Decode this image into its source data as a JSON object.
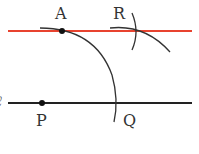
{
  "diagram": {
    "type": "geometric-construction",
    "points": {
      "A": {
        "label": "A",
        "x": 62,
        "y": 31
      },
      "R": {
        "label": "R",
        "x": 134,
        "y": 31
      },
      "P": {
        "label": "P",
        "x": 42,
        "y": 103
      },
      "Q": {
        "label": "Q",
        "x": 116,
        "y": 103
      }
    },
    "line_label": "ℓ",
    "colors": {
      "parallel_line": "#e8432f",
      "line_l": "#222222",
      "arcs": "#333333"
    }
  }
}
